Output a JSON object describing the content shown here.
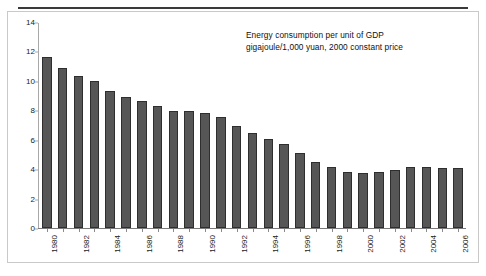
{
  "figure": {
    "width": 486,
    "height": 276,
    "background": "#ffffff",
    "rule_color": "#3a3a3a",
    "frame_color": "#c9c9c9"
  },
  "annotation": {
    "line1": "Energy consumption per unit of GDP",
    "line2": "gigajoule/1,000 yuan, 2000 constant price"
  },
  "chart_data": {
    "type": "bar",
    "title": "Energy consumption per unit of GDP",
    "subtitle": "gigajoule/1,000 yuan, 2000 constant price",
    "xlabel": "",
    "ylabel": "",
    "ylim": [
      0,
      14
    ],
    "yticks": [
      0,
      2,
      4,
      6,
      8,
      10,
      12,
      14
    ],
    "ytick_labels": [
      "0",
      "2",
      "4",
      "6",
      "8",
      "10",
      "12",
      "14"
    ],
    "grid": false,
    "legend": "none",
    "bar_color": "#565656",
    "bar_edge_color": "#2e2e2e",
    "categories": [
      "1980",
      "1981",
      "1982",
      "1983",
      "1984",
      "1985",
      "1986",
      "1987",
      "1988",
      "1989",
      "1990",
      "1991",
      "1992",
      "1993",
      "1994",
      "1995",
      "1996",
      "1997",
      "1998",
      "1999",
      "2000",
      "2001",
      "2002",
      "2003",
      "2004",
      "2005",
      "2006"
    ],
    "tick_labels_shown": [
      "1980",
      "1982",
      "1984",
      "1986",
      "1988",
      "1990",
      "1992",
      "1994",
      "1996",
      "1998",
      "2000",
      "2002",
      "2004",
      "2006"
    ],
    "values": [
      11.65,
      10.9,
      10.4,
      10.05,
      9.35,
      8.95,
      8.65,
      8.3,
      8.0,
      8.0,
      7.85,
      7.55,
      7.0,
      6.5,
      6.1,
      5.75,
      5.15,
      4.5,
      4.15,
      3.85,
      3.75,
      3.8,
      3.95,
      4.15,
      4.15,
      4.1,
      4.1
    ]
  }
}
